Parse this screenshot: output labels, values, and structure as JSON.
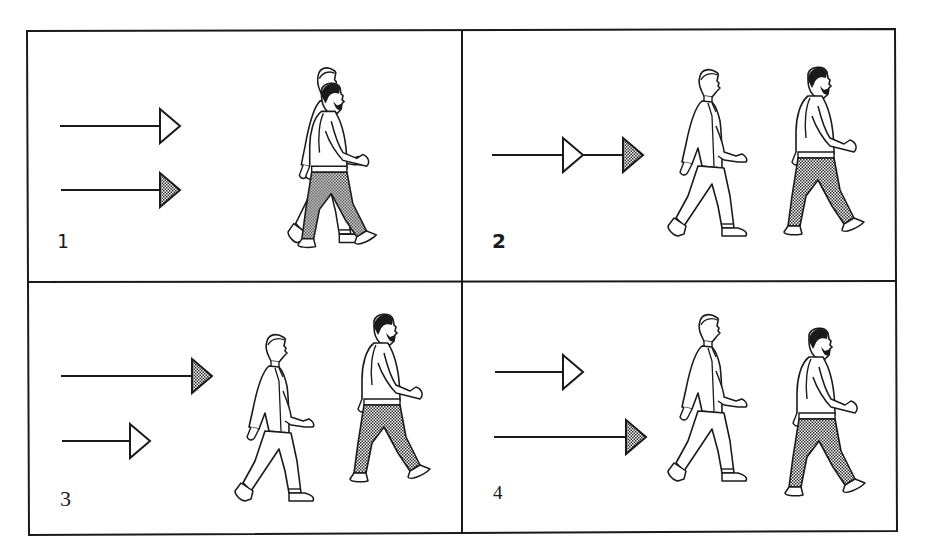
{
  "figure": {
    "type": "four-panel walking-speed diagram",
    "colors": {
      "line": "#1a1a1a",
      "background": "#ffffff",
      "hatch_dark": "#2a2a2a",
      "hatch_light": "#ffffff"
    },
    "legend": {
      "hollow_arrow": "man in suit (white figure)",
      "filled_arrow": "bearded man in checkered trousers"
    },
    "panels": [
      {
        "id": 1,
        "label": "1",
        "arrows": [
          {
            "style": "hollow",
            "length": "long",
            "order": "top"
          },
          {
            "style": "filled",
            "length": "long",
            "order": "bottom"
          }
        ],
        "figures": "overlapping (walking side by side)"
      },
      {
        "id": 2,
        "label": "2",
        "arrows": [
          {
            "style": "hollow-then-filled",
            "length": "chained",
            "order": "single line"
          }
        ],
        "figures": "suit man behind, bearded man ahead"
      },
      {
        "id": 3,
        "label": "3",
        "arrows": [
          {
            "style": "filled",
            "length": "long",
            "order": "top"
          },
          {
            "style": "hollow",
            "length": "short",
            "order": "bottom"
          }
        ],
        "figures": "suit man behind, bearded man ahead and higher"
      },
      {
        "id": 4,
        "label": "4",
        "arrows": [
          {
            "style": "hollow",
            "length": "short",
            "order": "top"
          },
          {
            "style": "filled",
            "length": "long",
            "order": "bottom"
          }
        ],
        "figures": "suit man behind and higher, bearded man ahead and lower"
      }
    ]
  }
}
